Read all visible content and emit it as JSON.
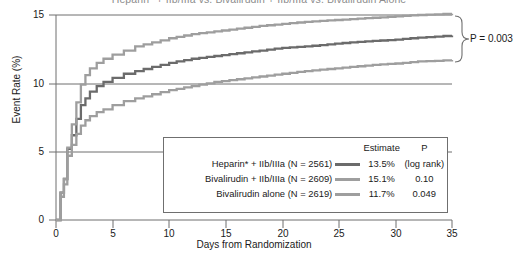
{
  "chart_data": {
    "type": "line",
    "title": "Heparin* + IIb/IIIa vs. Bivalirudin + IIb/IIIa vs. Bivalirudin Alone",
    "xlabel": "Days from Randomization",
    "ylabel": "Event Rate (%)",
    "xlim": [
      0,
      35
    ],
    "ylim": [
      0,
      15
    ],
    "xticks": [
      "0",
      "5",
      "10",
      "15",
      "20",
      "25",
      "30",
      "35"
    ],
    "yticks": [
      "0",
      "5",
      "10",
      "15"
    ],
    "grid": "horizontal-at-5-10-15",
    "legend_position": "inside-lower-right",
    "annotation": "P = 0.003",
    "series": [
      {
        "name": "Heparin* + IIb/IIIa (N = 2561)",
        "estimate": "13.5%",
        "p": "(log rank)",
        "color": "#6b6b6b",
        "final_value": 13.5,
        "x": [
          0,
          0.4,
          0.7,
          1.0,
          1.4,
          1.8,
          2.2,
          2.6,
          3.0,
          3.6,
          4.2,
          5.0,
          6.0,
          7.0,
          8.5,
          10.0,
          12.0,
          14.0,
          16.0,
          18.0,
          20.0,
          22.0,
          24.0,
          26.0,
          28.0,
          30.0,
          32.0,
          35.0
        ],
        "y": [
          0,
          2.0,
          3.0,
          5.2,
          6.2,
          7.4,
          8.4,
          8.9,
          9.4,
          9.8,
          10.1,
          10.4,
          10.7,
          10.9,
          11.2,
          11.5,
          11.8,
          12.0,
          12.2,
          12.4,
          12.6,
          12.7,
          12.85,
          13.0,
          13.1,
          13.2,
          13.35,
          13.5
        ]
      },
      {
        "name": "Bivalirudin + IIb/IIIa (N = 2609)",
        "estimate": "15.1%",
        "p": "0.10",
        "color": "#9e9e9e",
        "final_value": 15.1,
        "x": [
          0,
          0.4,
          0.7,
          1.0,
          1.4,
          1.8,
          2.2,
          2.6,
          3.0,
          3.6,
          4.2,
          5.0,
          6.0,
          7.0,
          8.5,
          10.0,
          12.0,
          14.0,
          16.0,
          18.0,
          20.0,
          22.0,
          24.0,
          26.0,
          28.0,
          30.0,
          32.0,
          35.0
        ],
        "y": [
          0,
          2.0,
          3.0,
          5.3,
          7.0,
          8.6,
          9.9,
          10.6,
          11.1,
          11.5,
          11.8,
          12.1,
          12.4,
          12.7,
          13.0,
          13.3,
          13.6,
          13.8,
          14.0,
          14.2,
          14.35,
          14.5,
          14.6,
          14.7,
          14.8,
          14.9,
          15.0,
          15.1
        ]
      },
      {
        "name": "Bivalirudin alone (N = 2619)",
        "estimate": "11.7%",
        "p": "0.049",
        "color": "#9e9e9e",
        "final_value": 11.7,
        "x": [
          0,
          0.4,
          0.7,
          1.0,
          1.4,
          1.8,
          2.2,
          2.6,
          3.0,
          3.6,
          4.2,
          5.0,
          6.0,
          7.0,
          8.5,
          10.0,
          12.0,
          14.0,
          16.0,
          18.0,
          20.0,
          22.0,
          24.0,
          26.0,
          28.0,
          30.0,
          32.0,
          35.0
        ],
        "y": [
          0,
          1.7,
          2.6,
          4.7,
          5.5,
          6.3,
          6.9,
          7.3,
          7.6,
          7.9,
          8.1,
          8.4,
          8.7,
          8.9,
          9.2,
          9.5,
          9.8,
          10.1,
          10.3,
          10.5,
          10.7,
          10.9,
          11.05,
          11.2,
          11.35,
          11.45,
          11.6,
          11.7
        ]
      }
    ],
    "legend_headers": [
      "",
      "",
      "Estimate",
      "P"
    ]
  }
}
